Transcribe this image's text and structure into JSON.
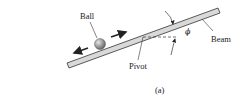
{
  "figure": {
    "caption": "(a)",
    "labels": {
      "ball": "Ball",
      "beam": "Beam",
      "pivot": "Pivot",
      "angle": "ϕ"
    },
    "colors": {
      "beam_fill": "#d9d9d9",
      "stroke": "#333333",
      "ball_light": "#cfcfcf",
      "ball_dark": "#5a5a5a"
    }
  }
}
